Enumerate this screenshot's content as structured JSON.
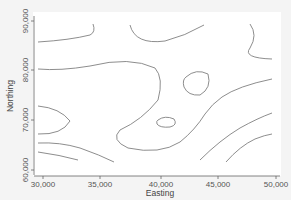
{
  "chart_data": {
    "type": "contour",
    "title": "",
    "xlabel": "Easting",
    "ylabel": "Northing",
    "xlim": [
      29000,
      50500
    ],
    "ylim": [
      59000,
      91000
    ],
    "xticks": [
      30000,
      35000,
      40000,
      45000,
      50000
    ],
    "xtick_labels": [
      "30,000",
      "35,000",
      "40,000",
      "45,000",
      "50,000"
    ],
    "yticks": [
      60000,
      70000,
      80000,
      90000
    ],
    "ytick_labels": [
      "60,000",
      "70,000",
      "80,000",
      "90,000"
    ],
    "grid": false,
    "legend": null,
    "line_color": "#808080",
    "contours": [
      {
        "id": "top-left",
        "path": "M 38 42 Q 70 40 90 35 Q 96 32 93 24"
      },
      {
        "id": "top-center",
        "path": "M 130 25 Q 135 45 165 41 Q 185 36 204 25"
      },
      {
        "id": "top-right",
        "path": "M 250 24 Q 258 35 250 48 Q 242 58 272 59"
      },
      {
        "id": "upper-band",
        "path": "M 38 69 Q 60 71 90 66 Q 130 56 155 68 Q 164 78 158 100 Q 142 120 120 130 Q 110 140 128 148 Q 160 155 180 142 Q 195 130 205 114 Q 212 104 222 97 Q 238 86 272 79"
      },
      {
        "id": "ellipse-upper-right",
        "path": "M 186 77 Q 196 68 208 74 Q 212 88 200 95 Q 188 96 184 87 Q 182 80 186 77 Z"
      },
      {
        "id": "ellipse-center",
        "path": "M 158 120 Q 165 115 174 119 Q 178 125 170 127 Q 160 128 157 124 Q 156 121 158 120 Z"
      },
      {
        "id": "left-loop",
        "path": "M 38 106 Q 60 108 70 121 Q 62 135 38 134"
      },
      {
        "id": "lower-band-1",
        "path": "M 38 143 Q 60 142 80 148 Q 100 155 114 162"
      },
      {
        "id": "lower-band-2",
        "path": "M 38 152 Q 60 155 78 160"
      },
      {
        "id": "right-lower-1",
        "path": "M 200 160 Q 220 140 240 128 Q 258 118 272 113"
      },
      {
        "id": "right-lower-2",
        "path": "M 226 162 Q 240 146 255 139 Q 265 135 272 134"
      }
    ]
  },
  "axes": {
    "x_title": "Easting",
    "y_title": "Northing",
    "x_ticks": [
      {
        "label": "30,000",
        "px": 43
      },
      {
        "label": "35,000",
        "px": 100
      },
      {
        "label": "40,000",
        "px": 161
      },
      {
        "label": "45,000",
        "px": 218
      },
      {
        "label": "50,000",
        "px": 276
      }
    ],
    "y_ticks": [
      {
        "label": "90,000",
        "py": 21
      },
      {
        "label": "80,000",
        "py": 70
      },
      {
        "label": "70,000",
        "py": 120
      },
      {
        "label": "60,000",
        "py": 170
      }
    ]
  }
}
